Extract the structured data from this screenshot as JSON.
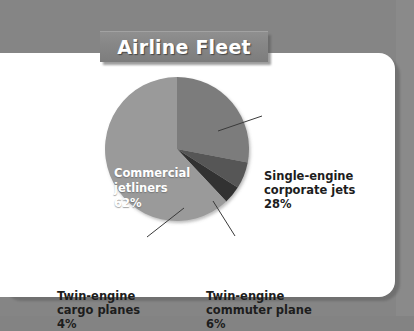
{
  "banner": {
    "title": "Airline Fleet"
  },
  "chart_data": {
    "type": "pie",
    "title": "Airline Fleet",
    "xlabel": "",
    "ylabel": "",
    "unit": "%",
    "legend_position": "callout-labels",
    "grid": false,
    "start_angle_deg": 0,
    "direction": "clockwise",
    "categories": [
      "Commercial jetliners",
      "Single-engine corporate jets",
      "Twin-engine commuter plane",
      "Twin-engine cargo planes"
    ],
    "values": [
      62,
      28,
      6,
      4
    ],
    "colors": [
      "#9a9a9a",
      "#7b7b7b",
      "#565656",
      "#333333"
    ],
    "slices": [
      {
        "name": "Commercial jetliners",
        "line1": "Commercial",
        "line2": "jetliners",
        "value_label": "62%",
        "value": 62,
        "color": "#9a9a9a",
        "label_placement": "inside",
        "label_color": "#ffffff"
      },
      {
        "name": "Single-engine corporate jets",
        "line1": "Single-engine",
        "line2": "corporate jets",
        "value_label": "28%",
        "value": 28,
        "color": "#7b7b7b",
        "label_placement": "right",
        "label_color": "#1d1d1d"
      },
      {
        "name": "Twin-engine commuter plane",
        "line1": "Twin-engine",
        "line2": "commuter plane",
        "value_label": "6%",
        "value": 6,
        "color": "#565656",
        "label_placement": "bottom-right",
        "label_color": "#1d1d1d"
      },
      {
        "name": "Twin-engine cargo planes",
        "line1": "Twin-engine",
        "line2": "cargo planes",
        "value_label": "4%",
        "value": 4,
        "color": "#333333",
        "label_placement": "bottom-left",
        "label_color": "#1d1d1d"
      }
    ]
  },
  "theme": {
    "page_background": "#858585",
    "card_background": "#ffffff",
    "banner_background": "#868686",
    "banner_text": "#ffffff",
    "label_text": "#1d1d1d",
    "leader_line": "#3a3a3a"
  }
}
